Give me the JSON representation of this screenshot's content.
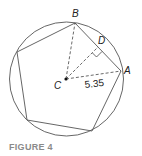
{
  "figure": {
    "caption": "FIGURE 4",
    "labels": {
      "B": "B",
      "D": "D",
      "A": "A",
      "C": "C",
      "radius": "5.35"
    },
    "colors": {
      "stroke": "#555555",
      "text": "#222222",
      "caption": "#8a8a8a"
    },
    "shapes": {
      "circle": {
        "cx": 66.5,
        "cy": 79,
        "r": 57
      },
      "pentagon_vertices": [
        [
          75,
          23
        ],
        [
          121,
          71
        ],
        [
          92,
          131
        ],
        [
          27,
          120
        ],
        [
          17,
          52
        ]
      ],
      "center": [
        66,
        79
      ],
      "point_D": [
        98,
        47
      ]
    }
  }
}
